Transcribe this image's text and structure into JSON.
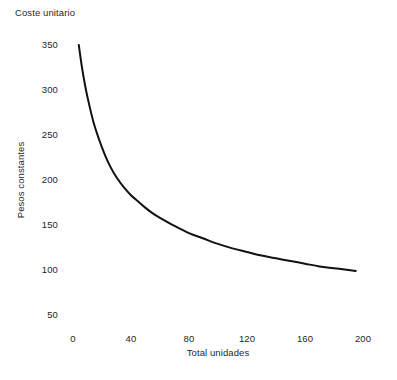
{
  "chart_data": {
    "type": "line",
    "title": "Coste unitario",
    "xlabel": "Total unidades",
    "ylabel": "Pesos constantes",
    "xlim": [
      0,
      200
    ],
    "ylim": [
      50,
      350
    ],
    "grid": false,
    "legend": null,
    "xticks": [
      0,
      40,
      80,
      120,
      160,
      200
    ],
    "xtick_labels": [
      "0",
      "40",
      "80",
      "120",
      "160",
      "200"
    ],
    "yticks": [
      50,
      100,
      150,
      200,
      250,
      300,
      350
    ],
    "ytick_labels": [
      "50",
      "100",
      "150",
      "200",
      "250",
      "300",
      "350"
    ],
    "line_color": "#111111",
    "line_width": 2,
    "series": [
      {
        "name": "Coste unitario",
        "x": [
          4,
          6,
          8,
          10,
          14,
          18,
          22,
          26,
          30,
          35,
          40,
          45,
          50,
          55,
          60,
          70,
          80,
          90,
          100,
          110,
          120,
          130,
          140,
          150,
          160,
          170,
          180,
          190,
          195
        ],
        "y": [
          350,
          327,
          308,
          292,
          265,
          245,
          228,
          214,
          203,
          192,
          183,
          176,
          169,
          163,
          158,
          149,
          141,
          135,
          129,
          124,
          120,
          116,
          113,
          110,
          107,
          104,
          102,
          100,
          99
        ]
      }
    ]
  },
  "axis": {
    "title_text": "Coste unitario",
    "x_label_text": "Total unidades",
    "y_label_text": "Pesos constantes"
  },
  "geometry": {
    "x0_px": 73,
    "x_per_unit_px": 1.45,
    "y_top_px": 45,
    "y_top_value": 350,
    "px_per_50": 45
  }
}
